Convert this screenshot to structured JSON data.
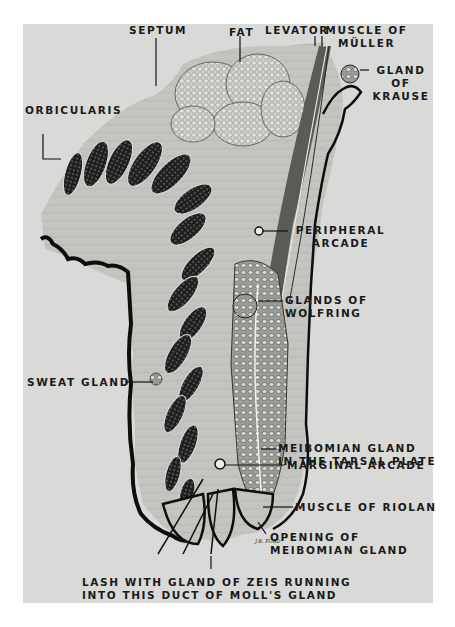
{
  "figure": {
    "background_color": "#d9d9d7",
    "ink_color": "#1a1a1a",
    "signature": "J.R. FORD"
  },
  "labels": {
    "septum": "SEPTUM",
    "fat": "FAT",
    "levator": "LEVATOR",
    "muscle_of_muller_line1": "MUSCLE OF",
    "muscle_of_muller_line2": "MÜLLER",
    "gland_of_krause_line1": "GLAND",
    "gland_of_krause_line2": "OF",
    "gland_of_krause_line3": "KRAUSE",
    "orbicularis": "ORBICULARIS",
    "peripheral_arcade_line1": "PERIPHERAL",
    "peripheral_arcade_line2": "ARCADE",
    "glands_of_wolfring_line1": "GLANDS OF",
    "glands_of_wolfring_line2": "WOLFRING",
    "sweat_gland": "SWEAT GLAND",
    "meibomian_gland_line1": "MEIBOMIAN GLAND",
    "meibomian_gland_line2": "IN THE TARSAL PLATE",
    "marginal_arcade": "MARGINAL ARCADE",
    "muscle_of_riolan": "MUSCLE OF RIOLAN",
    "opening_meibomian_line1": "OPENING OF",
    "opening_meibomian_line2": "MEIBOMIAN GLAND",
    "lash_line1": "LASH WITH GLAND OF ZEIS RUNNING",
    "lash_line2": "INTO THIS DUCT OF MOLL'S GLAND"
  }
}
